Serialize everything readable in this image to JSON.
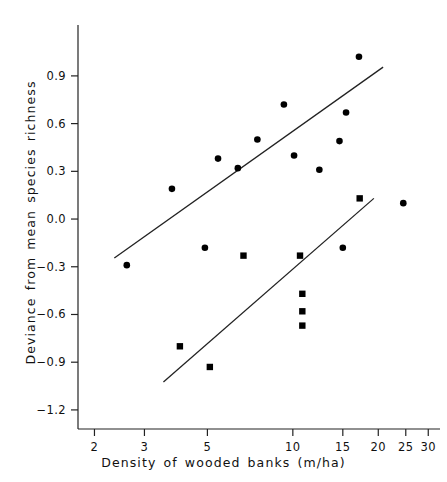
{
  "chart_data": {
    "type": "scatter",
    "title": "",
    "xlabel": "Density of wooded banks (m/ha)",
    "ylabel": "Deviance from mean species richness",
    "xscale": "log",
    "yscale": "linear",
    "xlim": [
      1.75,
      33
    ],
    "ylim": [
      -1.32,
      1.22
    ],
    "grid": false,
    "legend": null,
    "xticks": [
      2,
      3,
      5,
      10,
      15,
      20,
      25,
      30
    ],
    "xtick_labels": [
      "2",
      "3",
      "5",
      "10",
      "15",
      "20",
      "25",
      "30"
    ],
    "yticks": [
      0.9,
      0.6,
      0.3,
      0.0,
      -0.3,
      -0.6,
      -0.9,
      -1.2
    ],
    "ytick_labels": [
      "0.9",
      "0.6",
      "0.3",
      "0.0",
      "-0.3",
      "-0.6",
      "-0.9",
      "-1.2"
    ],
    "series": [
      {
        "name": "circles",
        "marker": "circle",
        "color": "#000000",
        "points": [
          {
            "x": 2.6,
            "y": -0.29
          },
          {
            "x": 3.75,
            "y": 0.19
          },
          {
            "x": 5.45,
            "y": 0.38
          },
          {
            "x": 4.9,
            "y": -0.18
          },
          {
            "x": 6.4,
            "y": 0.32
          },
          {
            "x": 7.5,
            "y": 0.5
          },
          {
            "x": 9.3,
            "y": 0.72
          },
          {
            "x": 10.1,
            "y": 0.4
          },
          {
            "x": 12.4,
            "y": 0.31
          },
          {
            "x": 14.6,
            "y": 0.49
          },
          {
            "x": 15.4,
            "y": 0.67
          },
          {
            "x": 15.0,
            "y": -0.18
          },
          {
            "x": 17.1,
            "y": 1.02
          },
          {
            "x": 24.5,
            "y": 0.1
          }
        ]
      },
      {
        "name": "squares",
        "marker": "square",
        "color": "#000000",
        "points": [
          {
            "x": 4.0,
            "y": -0.8
          },
          {
            "x": 5.1,
            "y": -0.93
          },
          {
            "x": 6.7,
            "y": -0.23
          },
          {
            "x": 10.6,
            "y": -0.23
          },
          {
            "x": 10.8,
            "y": -0.47
          },
          {
            "x": 10.8,
            "y": -0.58
          },
          {
            "x": 10.8,
            "y": -0.67
          },
          {
            "x": 17.2,
            "y": 0.13
          }
        ]
      }
    ],
    "fit_lines": [
      {
        "name": "upper-regression-line",
        "x_start": 2.35,
        "y_start": -0.245,
        "x_end": 20.8,
        "y_end": 0.955
      },
      {
        "name": "lower-regression-line",
        "x_start": 3.5,
        "y_start": -1.025,
        "x_end": 19.3,
        "y_end": 0.13
      }
    ]
  }
}
